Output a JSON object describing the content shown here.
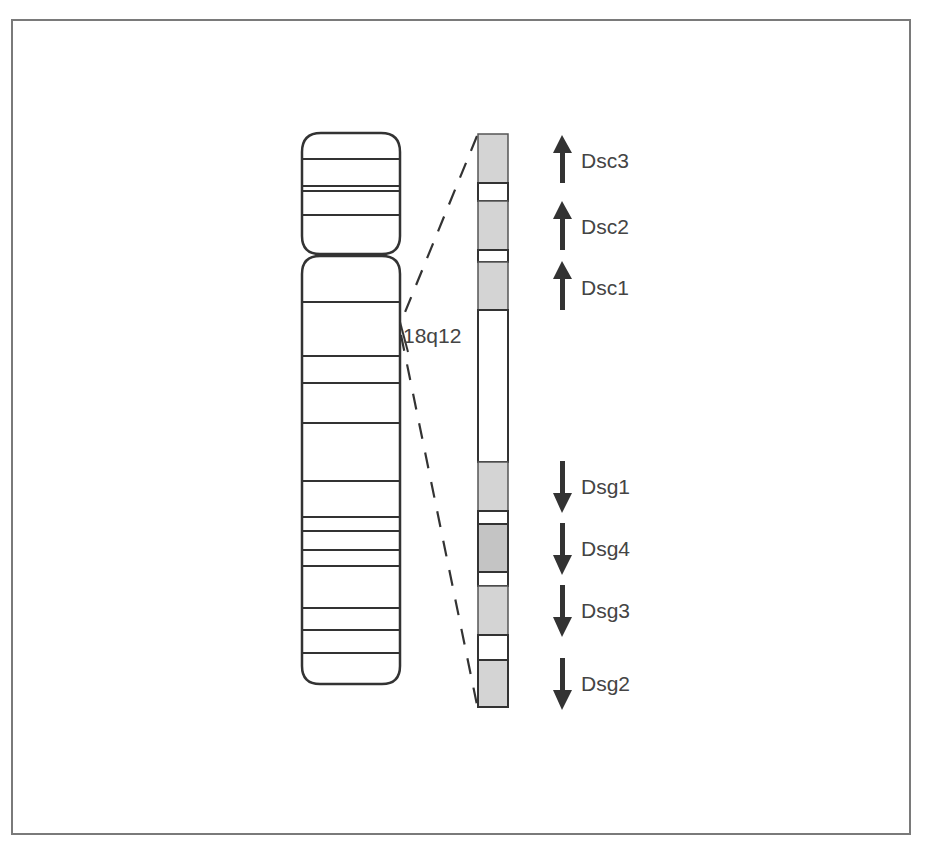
{
  "figure": {
    "region_label": "18q12",
    "colors": {
      "outline": "#333333",
      "band_gray": "#d4d4d4",
      "band_gray_dark": "#c4c4c4",
      "text": "#444444",
      "frame": "#7a7a7a"
    },
    "chromosome": {
      "p_arm_bands_y": [
        159,
        186,
        191,
        215
      ],
      "q_arm_bands_y": [
        302,
        356,
        383,
        423,
        481,
        517,
        531,
        550,
        566,
        608,
        630,
        653
      ]
    },
    "genes": [
      {
        "name": "Dsc3",
        "direction": "up"
      },
      {
        "name": "Dsc2",
        "direction": "up"
      },
      {
        "name": "Dsc1",
        "direction": "up"
      },
      {
        "name": "Dsg1",
        "direction": "down"
      },
      {
        "name": "Dsg4",
        "direction": "down"
      },
      {
        "name": "Dsg3",
        "direction": "down"
      },
      {
        "name": "Dsg2",
        "direction": "down"
      }
    ]
  }
}
